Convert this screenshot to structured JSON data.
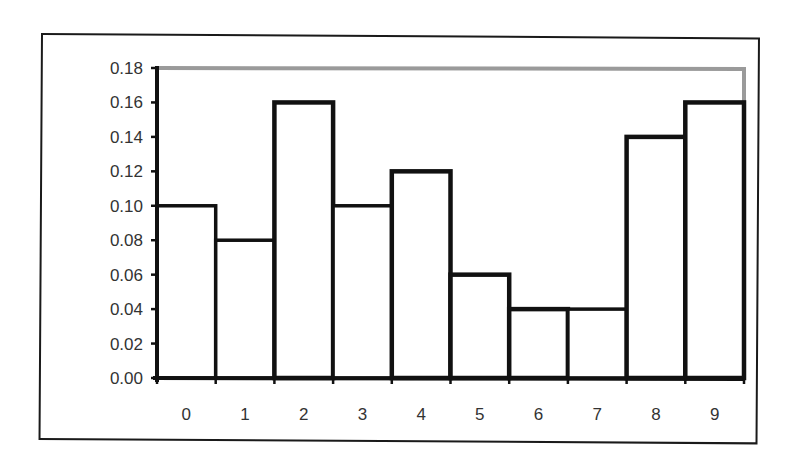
{
  "chart_data": {
    "type": "bar",
    "title": "",
    "xlabel": "",
    "ylabel": "",
    "categories": [
      "0",
      "1",
      "2",
      "3",
      "4",
      "5",
      "6",
      "7",
      "8",
      "9"
    ],
    "values": [
      0.1,
      0.08,
      0.16,
      0.1,
      0.12,
      0.06,
      0.04,
      0.04,
      0.14,
      0.16
    ],
    "ylim": [
      0,
      0.18
    ],
    "yticks": [
      "0.00",
      "0.02",
      "0.04",
      "0.06",
      "0.08",
      "0.10",
      "0.12",
      "0.14",
      "0.16",
      "0.18"
    ],
    "grid": false,
    "legend": null,
    "bar_fill": "#ffffff",
    "bar_edge": "#111111",
    "plot_border_color": "#9a9a9a"
  }
}
